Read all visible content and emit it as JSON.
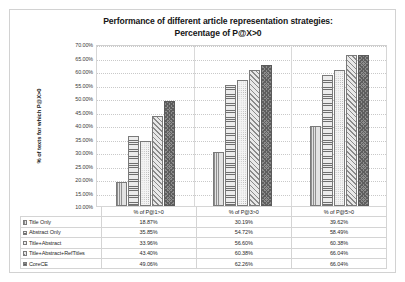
{
  "chart_data": {
    "type": "bar",
    "title": "Performance of different article representation strategies: Percentage of P@X>0",
    "title_line1": "Performance of different article representation strategies:",
    "title_line2": "Percentage of P@X>0",
    "xlabel": "",
    "ylabel": "% of texts for which P@X>0",
    "ylim": [
      10,
      70
    ],
    "ytick_labels": [
      "70.00%",
      "65.00%",
      "60.00%",
      "55.00%",
      "50.00%",
      "45.00%",
      "40.00%",
      "35.00%",
      "30.00%",
      "25.00%",
      "20.00%",
      "15.00%",
      "10.00%"
    ],
    "ytick_values": [
      70,
      65,
      60,
      55,
      50,
      45,
      40,
      35,
      30,
      25,
      20,
      15,
      10
    ],
    "grid": true,
    "legend_position": "bottom-table",
    "categories": [
      "% of P@1>0",
      "% of P@3>0",
      "% of P@5>0"
    ],
    "series": [
      {
        "name": "Title Only",
        "pattern": "vertical-lines",
        "values": [
          18.87,
          30.19,
          39.62
        ],
        "labels": [
          "18.87%",
          "30.19%",
          "39.62%"
        ]
      },
      {
        "name": "Abstract Only",
        "pattern": "horizontal-lines",
        "values": [
          35.85,
          54.72,
          58.49
        ],
        "labels": [
          "35.85%",
          "54.72%",
          "58.49%"
        ]
      },
      {
        "name": "Title+Abstract",
        "pattern": "dots",
        "values": [
          33.96,
          56.6,
          60.38
        ],
        "labels": [
          "33.96%",
          "56.60%",
          "60.38%"
        ]
      },
      {
        "name": "Title+Abstract+RefTitles",
        "pattern": "diagonal-stripes",
        "values": [
          43.4,
          60.38,
          66.04
        ],
        "labels": [
          "43.40%",
          "60.38%",
          "66.04%"
        ]
      },
      {
        "name": "CoreCE",
        "pattern": "crosshatch-dark",
        "values": [
          49.06,
          62.26,
          66.04
        ],
        "labels": [
          "49.06%",
          "62.26%",
          "66.04%"
        ]
      }
    ]
  }
}
